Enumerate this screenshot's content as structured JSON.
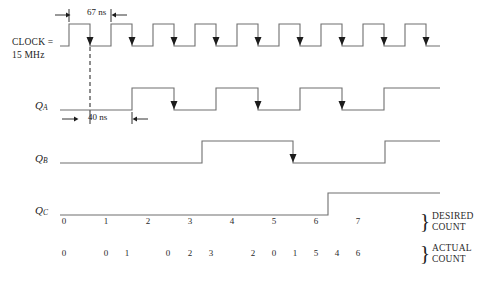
{
  "figure": {
    "type": "timing-diagram"
  },
  "signals": {
    "clock": {
      "name_line1": "CLOCK =",
      "name_line2": "15 MHz",
      "period_annotation": "67 ns",
      "pulses": 8,
      "edge_marker": "falling-edge-arrow",
      "edge_count": 8
    },
    "qa": {
      "label": "Q",
      "subscript": "A",
      "delay_annotation": "40 ns",
      "edge_marker": "falling-edge-arrow",
      "edge_count": 3
    },
    "qb": {
      "label": "Q",
      "subscript": "B",
      "edge_marker": "falling-edge-arrow",
      "edge_count": 1
    },
    "qc": {
      "label": "Q",
      "subscript": "C"
    }
  },
  "desired_count": {
    "brace": "}",
    "caption_line1": "DESIRED",
    "caption_line2": "COUNT",
    "values": [
      "0",
      "1",
      "2",
      "3",
      "4",
      "5",
      "6",
      "7"
    ]
  },
  "actual_count": {
    "brace": "}",
    "caption_line1": "ACTUAL",
    "caption_line2": "COUNT",
    "values": [
      "0",
      "0",
      "1",
      "0",
      "2",
      "3",
      "2",
      "0",
      "1",
      "5",
      "4",
      "6"
    ]
  },
  "chart_data": {
    "type": "line",
    "xlabel": "",
    "ylabel": "",
    "series": [
      {
        "name": "CLOCK = 15 MHz",
        "values": [
          0,
          1,
          0,
          1,
          0,
          1,
          0,
          1,
          0,
          1,
          0,
          1,
          0,
          1,
          0,
          1,
          0
        ]
      },
      {
        "name": "QA",
        "values": [
          0,
          0,
          1,
          1,
          0,
          0,
          1,
          1,
          0,
          0,
          1,
          1,
          0,
          0,
          1,
          1
        ]
      },
      {
        "name": "QB",
        "values": [
          0,
          0,
          0,
          0,
          1,
          1,
          1,
          1,
          0,
          0,
          0,
          0,
          1,
          1,
          1,
          1
        ]
      },
      {
        "name": "QC",
        "values": [
          0,
          0,
          0,
          0,
          0,
          0,
          0,
          0,
          1,
          1,
          1,
          1,
          1,
          1,
          1,
          1
        ]
      }
    ],
    "annotations": [
      "67 ns",
      "40 ns"
    ],
    "legend": "none",
    "grid": false
  },
  "colors": {
    "waveform": "#6f6f6f",
    "text": "#1c1c1c",
    "background": "#ffffff",
    "marker": "#1c1c1c"
  }
}
